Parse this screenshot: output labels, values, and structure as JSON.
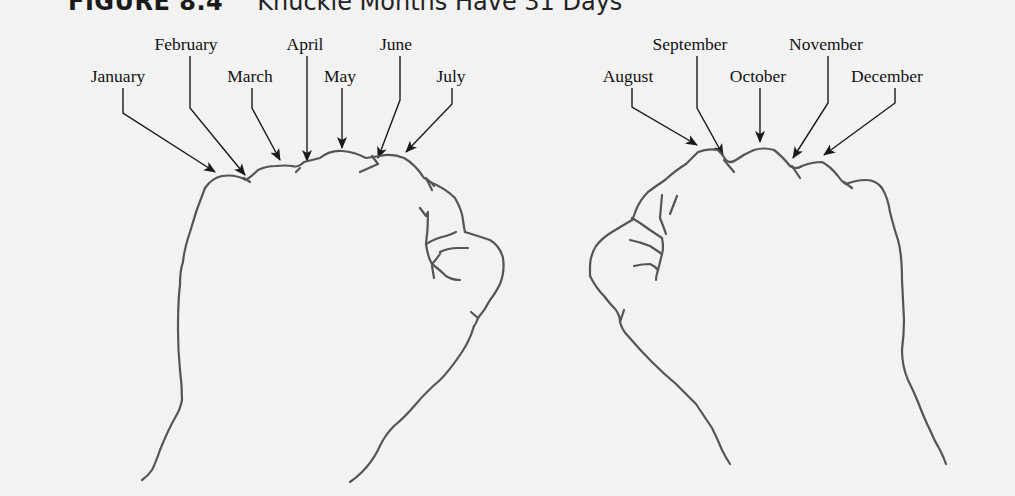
{
  "figure": {
    "number": "FIGURE 8.4",
    "caption": "Knuckle Months Have 31 Days"
  },
  "left_hand": {
    "labels": [
      {
        "name": "January",
        "x": 118,
        "y": 66
      },
      {
        "name": "February",
        "x": 186,
        "y": 34
      },
      {
        "name": "March",
        "x": 250,
        "y": 66
      },
      {
        "name": "April",
        "x": 305,
        "y": 34
      },
      {
        "name": "May",
        "x": 340,
        "y": 66
      },
      {
        "name": "June",
        "x": 396,
        "y": 34
      },
      {
        "name": "July",
        "x": 451,
        "y": 66
      }
    ]
  },
  "right_hand": {
    "labels": [
      {
        "name": "August",
        "x": 628,
        "y": 66
      },
      {
        "name": "September",
        "x": 690,
        "y": 34
      },
      {
        "name": "October",
        "x": 758,
        "y": 66
      },
      {
        "name": "November",
        "x": 826,
        "y": 34
      },
      {
        "name": "December",
        "x": 887,
        "y": 66
      }
    ]
  },
  "colors": {
    "background": "#f3f3f3",
    "text": "#111111",
    "arrows": "#1a1a1a",
    "hand_outline": "#555555"
  }
}
